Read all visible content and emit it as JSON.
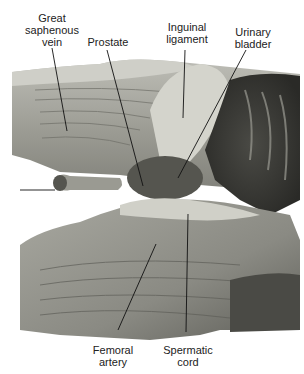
{
  "figure": {
    "labels": [
      {
        "id": "great-saphenous-vein",
        "text": "Great\nsaphenous\nvein"
      },
      {
        "id": "prostate",
        "text": "Prostate"
      },
      {
        "id": "inguinal-ligament",
        "text": "Inguinal\nligament"
      },
      {
        "id": "urinary-bladder",
        "text": "Urinary\nbladder"
      },
      {
        "id": "femoral-artery",
        "text": "Femoral\nartery"
      },
      {
        "id": "spermatic-cord",
        "text": "Spermatic\ncord"
      }
    ]
  }
}
